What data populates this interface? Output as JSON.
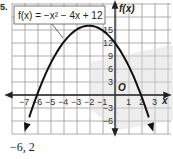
{
  "problem": {
    "number": "5."
  },
  "answer": {
    "text": "−6, 2"
  },
  "chart_data": {
    "type": "line",
    "title": "",
    "function_label": "f(x) = −x² − 4x + 12",
    "equation": {
      "a": -1,
      "b": -4,
      "c": 12
    },
    "xlabel": "x",
    "ylabel": "f(x)",
    "origin_label": "O",
    "xlim": [
      -8,
      4
    ],
    "ylim": [
      -8,
      18
    ],
    "x_ticks": [
      -7,
      -6,
      -5,
      -4,
      -3,
      -2,
      -1,
      1,
      2,
      3
    ],
    "x_tick_labels": [
      "−7",
      "−6",
      "−5",
      "−4",
      "−3",
      "−2",
      "−1",
      "1",
      "2",
      "3"
    ],
    "y_ticks": [
      15,
      12,
      9,
      6,
      3,
      -3,
      -6
    ],
    "y_tick_labels": [
      "15",
      "12",
      "9",
      "6",
      "3",
      "−3",
      "−6"
    ],
    "grid": true,
    "series": [
      {
        "name": "f(x) = −x² − 4x + 12",
        "x": [
          -6.9,
          -6,
          -5,
          -4,
          -3,
          -2,
          -1,
          0,
          1,
          2,
          2.9
        ],
        "values": [
          -8,
          0,
          7,
          12,
          15,
          16,
          15,
          12,
          7,
          0,
          -8
        ]
      }
    ],
    "key_points": {
      "vertex": [
        -2,
        16
      ],
      "roots": [
        -6,
        2
      ],
      "y_intercept": 12
    }
  }
}
